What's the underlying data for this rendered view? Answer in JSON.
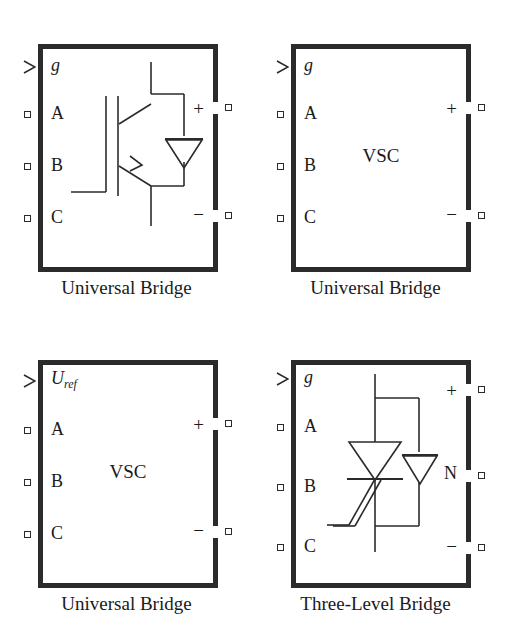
{
  "figure": {
    "name": "power-electronic-converter-blocks",
    "background_color": "#ffffff",
    "line_color": "#2b2b2b",
    "text_color": "#1a1a1a",
    "columns": 2,
    "rows": 2
  },
  "blocks": [
    {
      "id": "universal-bridge-igbt",
      "caption": "Universal Bridge",
      "center_text": "",
      "symbol": "igbt-with-antiparallel-diode",
      "input_ports": [
        {
          "label": "g",
          "type": "arrow",
          "italic": true,
          "subscript": ""
        },
        {
          "label": "A",
          "type": "square",
          "italic": false,
          "subscript": ""
        },
        {
          "label": "B",
          "type": "square",
          "italic": false,
          "subscript": ""
        },
        {
          "label": "C",
          "type": "square",
          "italic": false,
          "subscript": ""
        }
      ],
      "output_ports": [
        {
          "label": "+",
          "type": "square"
        },
        {
          "label": "−",
          "type": "square"
        }
      ]
    },
    {
      "id": "universal-bridge-vsc-g",
      "caption": "Universal Bridge",
      "center_text": "VSC",
      "symbol": "none",
      "input_ports": [
        {
          "label": "g",
          "type": "arrow",
          "italic": true,
          "subscript": ""
        },
        {
          "label": "A",
          "type": "square",
          "italic": false,
          "subscript": ""
        },
        {
          "label": "B",
          "type": "square",
          "italic": false,
          "subscript": ""
        },
        {
          "label": "C",
          "type": "square",
          "italic": false,
          "subscript": ""
        }
      ],
      "output_ports": [
        {
          "label": "+",
          "type": "square"
        },
        {
          "label": "−",
          "type": "square"
        }
      ]
    },
    {
      "id": "universal-bridge-vsc-uref",
      "caption": "Universal Bridge",
      "center_text": "VSC",
      "symbol": "none",
      "input_ports": [
        {
          "label": "U",
          "type": "arrow",
          "italic": true,
          "subscript": "ref"
        },
        {
          "label": "A",
          "type": "square",
          "italic": false,
          "subscript": ""
        },
        {
          "label": "B",
          "type": "square",
          "italic": false,
          "subscript": ""
        },
        {
          "label": "C",
          "type": "square",
          "italic": false,
          "subscript": ""
        }
      ],
      "output_ports": [
        {
          "label": "+",
          "type": "square"
        },
        {
          "label": "−",
          "type": "square"
        }
      ]
    },
    {
      "id": "three-level-bridge-gto",
      "caption": "Three-Level Bridge",
      "center_text": "",
      "symbol": "gto-with-antiparallel-diode",
      "input_ports": [
        {
          "label": "g",
          "type": "arrow",
          "italic": true,
          "subscript": ""
        },
        {
          "label": "A",
          "type": "square",
          "italic": false,
          "subscript": ""
        },
        {
          "label": "B",
          "type": "square",
          "italic": false,
          "subscript": ""
        },
        {
          "label": "C",
          "type": "square",
          "italic": false,
          "subscript": ""
        }
      ],
      "output_ports": [
        {
          "label": "+",
          "type": "square"
        },
        {
          "label": "N",
          "type": "square"
        },
        {
          "label": "−",
          "type": "square"
        }
      ]
    }
  ]
}
